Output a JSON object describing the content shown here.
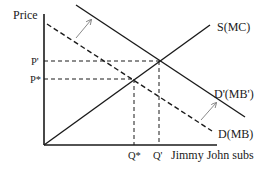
{
  "diagram": {
    "type": "supply-demand",
    "axis": {
      "y_label": "Price",
      "x_label": "Jimmy John subs"
    },
    "curves": [
      {
        "id": "supply",
        "label": "S(MC)",
        "style": "solid"
      },
      {
        "id": "demand_new",
        "label": "D'(MB')",
        "style": "solid"
      },
      {
        "id": "demand_old",
        "label": "D(MB)",
        "style": "dashed"
      }
    ],
    "price_ticks": [
      {
        "id": "p_prime",
        "label": "P'"
      },
      {
        "id": "p_star",
        "label": "P*"
      }
    ],
    "quantity_ticks": [
      {
        "id": "q_star",
        "label": "Q*"
      },
      {
        "id": "q_prime",
        "label": "Q'"
      }
    ],
    "shift": {
      "direction": "outward",
      "arrows": 2
    },
    "colors": {
      "line": "#1a1a1a",
      "arrow": "#8a8a8a",
      "background": "#ffffff"
    }
  }
}
